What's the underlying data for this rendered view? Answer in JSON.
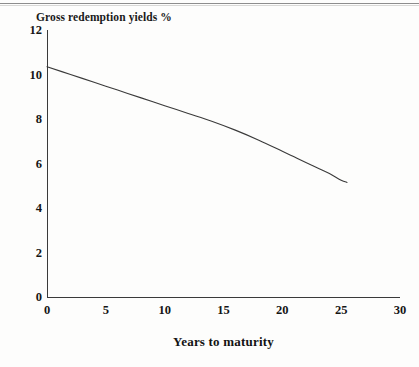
{
  "page": {
    "background_color": "#fdfdfc",
    "ink_color": "#1a1a1a"
  },
  "chart_data": {
    "type": "line",
    "title": "Gross redemption yields %",
    "xlabel": "Years to maturity",
    "ylabel": "",
    "xlim": [
      0,
      30
    ],
    "ylim": [
      0,
      12
    ],
    "grid": false,
    "legend": null,
    "xticks": [
      0,
      5,
      10,
      15,
      20,
      25,
      30
    ],
    "xtick_labels": [
      "0",
      "5",
      "10",
      "15",
      "20",
      "25",
      "30"
    ],
    "yticks": [
      0,
      2,
      4,
      6,
      8,
      10,
      12
    ],
    "ytick_labels": [
      "0",
      "2",
      "4",
      "6",
      "8",
      "10",
      "12"
    ],
    "series": [
      {
        "name": "Gross redemption yield curve",
        "color": "#3a3a3a",
        "x": [
          0,
          2,
          4,
          6,
          8,
          10,
          12,
          14,
          16,
          18,
          20,
          21,
          22,
          23,
          24,
          25,
          25.5
        ],
        "y": [
          10.35,
          10.0,
          9.65,
          9.3,
          8.95,
          8.6,
          8.25,
          7.9,
          7.5,
          7.05,
          6.55,
          6.3,
          6.05,
          5.8,
          5.55,
          5.25,
          5.15
        ]
      }
    ]
  }
}
